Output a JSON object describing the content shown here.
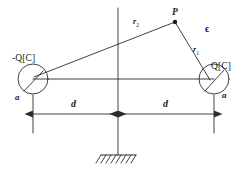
{
  "figure": {
    "stroke_color": "#2b2b2b",
    "background_color": "#ffffff",
    "labels": {
      "left_charge": "-Q[C]",
      "right_charge": "Q[C]",
      "left_radius_marker": "a",
      "right_radius_marker": "a",
      "field_point": "P",
      "distance_far": "r",
      "distance_far_sub": "2",
      "distance_near": "r",
      "distance_near_sub": "1",
      "permittivity": "ϵ",
      "separation_left": "d",
      "separation_right": "d"
    },
    "geometry": {
      "left_circle": {
        "cx": 33,
        "cy": 79,
        "r": 15
      },
      "right_circle": {
        "cx": 214,
        "cy": 79,
        "r": 15
      },
      "field_point": {
        "x": 175,
        "y": 22
      },
      "axis_x": 118,
      "baseline_y": 79,
      "dimension_y": 114,
      "ground_y": 155
    }
  }
}
